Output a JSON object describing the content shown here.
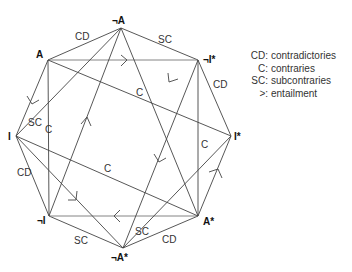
{
  "vertices": {
    "A": {
      "label": "A",
      "x": 48,
      "y": 60
    },
    "nA": {
      "label": "¬A",
      "x": 121,
      "y": 28
    },
    "nIs": {
      "label": "¬I*",
      "x": 198,
      "y": 60
    },
    "Is": {
      "label": "I*",
      "x": 231,
      "y": 136
    },
    "As": {
      "label": "A*",
      "x": 198,
      "y": 216
    },
    "nAs": {
      "label": "¬A*",
      "x": 123,
      "y": 248
    },
    "nI": {
      "label": "¬I",
      "x": 49,
      "y": 216
    },
    "I": {
      "label": "I",
      "x": 16,
      "y": 136
    }
  },
  "edge_labels": {
    "A_nA": "CD",
    "nA_nIs": "SC",
    "nIs_Is": "CD",
    "As_nAs": "CD",
    "nAs_nI": "SC",
    "nI_I": "CD",
    "A_Is": "C",
    "I_As": "C",
    "A_nI": "C",
    "nIs_As": "C",
    "nA_I": "SC",
    "nAs_Is": "SC"
  },
  "legend": [
    {
      "key": "CD:",
      "value": "contradictories"
    },
    {
      "key": "C:",
      "value": "contraries"
    },
    {
      "key": "SC:",
      "value": "subcontraries"
    },
    {
      "key": ">:",
      "value": "entailment"
    }
  ],
  "colors": {
    "line": "#444444",
    "text": "#333333",
    "background": "#ffffff"
  }
}
